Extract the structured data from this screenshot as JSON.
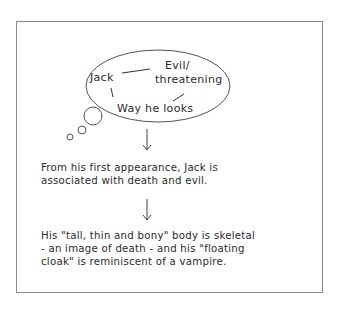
{
  "mind_map": {
    "nodes": {
      "jack": "Jack",
      "evil_line1": "Evil/",
      "evil_line2": "threatening",
      "looks": "Way he looks"
    }
  },
  "paragraphs": {
    "first": {
      "line1": "From his first appearance, Jack is",
      "line2": "associated with death and evil."
    },
    "second": {
      "line1": "His \"tall, thin and bony\" body is skeletal",
      "line2": "- an image of death - and his \"floating",
      "line3": "cloak\" is reminiscent of a vampire."
    }
  },
  "colors": {
    "ink": "#2a2a2a",
    "frame": "#8a8a8a"
  }
}
